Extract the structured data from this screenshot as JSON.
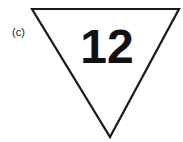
{
  "figure": {
    "panel_label": "(c)",
    "sign_shape": "inverted-triangle",
    "sign_number": "12",
    "stroke_color": "#1a1a1a",
    "fill_color": "#ffffff"
  }
}
